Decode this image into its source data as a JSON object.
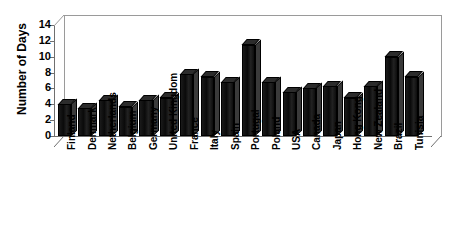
{
  "chart_data": {
    "type": "bar",
    "title": "",
    "xlabel": "",
    "ylabel": "Number of Days",
    "ylim": [
      0,
      14
    ],
    "yticks": [
      0,
      2,
      4,
      6,
      8,
      10,
      12,
      14
    ],
    "grid": false,
    "legend": false,
    "style": "3d-column",
    "bar_color": "#111111",
    "background_color": "#ffffff",
    "axis_color": "#6f6f6f",
    "categories": [
      "Finland",
      "Denmark",
      "Netherlands",
      "Belgium",
      "Germany",
      "United Kingdom",
      "France",
      "Italy",
      "Spain",
      "Portugal",
      "Poland",
      "USA",
      "Canada",
      "Japan",
      "Hong Kong",
      "New Zealand",
      "Brazil",
      "Tunisia"
    ],
    "values": [
      4.0,
      3.5,
      4.5,
      3.7,
      4.5,
      4.8,
      7.8,
      7.5,
      6.8,
      11.5,
      6.8,
      5.5,
      6.0,
      6.3,
      4.8,
      6.3,
      10.0,
      7.5
    ]
  }
}
